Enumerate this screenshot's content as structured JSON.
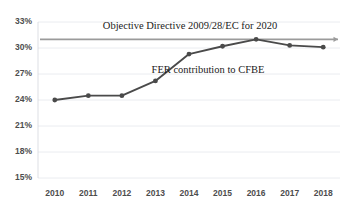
{
  "chart_data": {
    "type": "line",
    "title": "",
    "subtitle": "",
    "xlabel": "",
    "ylabel": "",
    "categories": [
      "2010",
      "2011",
      "2012",
      "2013",
      "2014",
      "2015",
      "2016",
      "2017",
      "2018"
    ],
    "series": [
      {
        "name": "FER contribution to CFBE",
        "values": [
          24.0,
          24.5,
          24.5,
          26.2,
          29.3,
          30.2,
          31.0,
          30.3,
          30.1
        ],
        "color": "#4a4a4a",
        "marker": "circle"
      }
    ],
    "reference_lines": [
      {
        "name": "Objective Directive 2009/28/EC for 2020",
        "value": 31.0,
        "color": "#9b9b9b",
        "arrow": "right"
      }
    ],
    "annotations": [
      {
        "id": "objective-annotation",
        "text": "Objective Directive 2009/28/EC for 2020",
        "x": 190,
        "y": 29
      },
      {
        "id": "series-annotation",
        "text": "FER contribution to CFBE",
        "x": 208,
        "y": 73
      }
    ],
    "ylim": [
      15,
      33
    ],
    "ytick_values": [
      15,
      18,
      21,
      24,
      27,
      30,
      33
    ],
    "ytick_labels": [
      "15%",
      "18%",
      "21%",
      "24%",
      "27%",
      "30%",
      "33%"
    ],
    "grid": true,
    "grid_axis": "y",
    "legend": "none",
    "legend_position": "inline-annotations",
    "background": "#ffffff"
  }
}
